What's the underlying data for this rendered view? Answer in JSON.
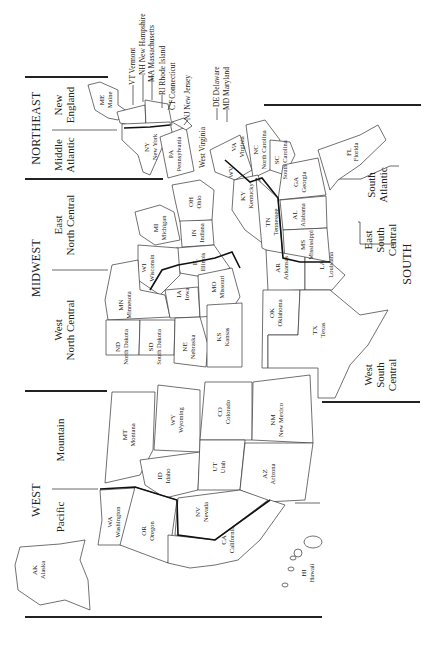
{
  "regions": [
    {
      "id": "northeast",
      "label": "NORTHEAST",
      "divisions": [
        {
          "id": "new-england",
          "label_line1": "New",
          "label_line2": "England"
        },
        {
          "id": "middle-atlantic",
          "label_line1": "Middle",
          "label_line2": "Atlantic"
        }
      ]
    },
    {
      "id": "midwest",
      "label": "MIDWEST",
      "divisions": [
        {
          "id": "east-north-central",
          "label_line1": "East",
          "label_line2": "North Central"
        },
        {
          "id": "west-north-central",
          "label_line1": "West",
          "label_line2": "North Central"
        }
      ]
    },
    {
      "id": "west",
      "label": "WEST",
      "divisions": [
        {
          "id": "mountain",
          "label_line1": "Mountain",
          "label_line2": ""
        },
        {
          "id": "pacific",
          "label_line1": "Pacific",
          "label_line2": ""
        }
      ]
    },
    {
      "id": "south",
      "label": "SOUTH",
      "divisions": [
        {
          "id": "south-atlantic",
          "label_line1": "South",
          "label_line2": "Atlantic"
        },
        {
          "id": "east-south-central",
          "label_line1": "East",
          "label_line2": "South",
          "label_line3": "Central"
        },
        {
          "id": "west-south-central",
          "label_line1": "West",
          "label_line2": "South",
          "label_line3": "Central"
        }
      ]
    }
  ],
  "callouts": {
    "vt": "VT Vermont",
    "nh": "NH New Hampshire",
    "ma": "MA Massachusetts",
    "ri": "RI Rhode Island",
    "ct": "CT Connecticut",
    "nj": "NJ New Jersey",
    "de": "DE Delaware",
    "md": "MD Maryland",
    "wv_full": "West Virginia"
  },
  "states": {
    "me": {
      "abbr": "ME",
      "name": "Maine"
    },
    "ny": {
      "abbr": "NY",
      "name": "New York"
    },
    "pa": {
      "abbr": "PA",
      "name": "Pennsylvania"
    },
    "oh": {
      "abbr": "OH",
      "name": "Ohio"
    },
    "mi": {
      "abbr": "MI",
      "name": "Michigan"
    },
    "in": {
      "abbr": "IN",
      "name": "Indiana"
    },
    "il": {
      "abbr": "IL",
      "name": "Illinois"
    },
    "wi": {
      "abbr": "WI",
      "name": "Wisconsin"
    },
    "mn": {
      "abbr": "MN",
      "name": "Minnesota"
    },
    "ia": {
      "abbr": "IA",
      "name": "Iowa"
    },
    "mo": {
      "abbr": "MO",
      "name": "Missouri"
    },
    "nd": {
      "abbr": "ND",
      "name": "North Dakota"
    },
    "sd": {
      "abbr": "SD",
      "name": "South Dakota"
    },
    "ne": {
      "abbr": "NE",
      "name": "Nebraska"
    },
    "ks": {
      "abbr": "KS",
      "name": "Kansas"
    },
    "wv": {
      "abbr": "WV",
      "name": ""
    },
    "va": {
      "abbr": "VA",
      "name": "Virginia"
    },
    "nc": {
      "abbr": "NC",
      "name": "North Carolina"
    },
    "sc": {
      "abbr": "SC",
      "name": "South Carolina"
    },
    "ga": {
      "abbr": "GA",
      "name": "Georgia"
    },
    "fl": {
      "abbr": "FL",
      "name": "Florida"
    },
    "ky": {
      "abbr": "KY",
      "name": "Kentucky"
    },
    "tn": {
      "abbr": "TN",
      "name": "Tennessee"
    },
    "al": {
      "abbr": "AL",
      "name": "Alabama"
    },
    "ms": {
      "abbr": "MS",
      "name": "Mississippi"
    },
    "ar": {
      "abbr": "AR",
      "name": "Arkansas"
    },
    "la": {
      "abbr": "LA",
      "name": "Louisiana"
    },
    "ok": {
      "abbr": "OK",
      "name": "Oklahoma"
    },
    "tx": {
      "abbr": "TX",
      "name": "Texas"
    },
    "mt": {
      "abbr": "MT",
      "name": "Montana"
    },
    "wy": {
      "abbr": "WY",
      "name": "Wyoming"
    },
    "co": {
      "abbr": "CO",
      "name": "Colorado"
    },
    "nm": {
      "abbr": "NM",
      "name": "New Mexico"
    },
    "id": {
      "abbr": "ID",
      "name": "Idaho"
    },
    "ut": {
      "abbr": "UT",
      "name": "Utah"
    },
    "az": {
      "abbr": "AZ",
      "name": "Arizona"
    },
    "wa": {
      "abbr": "WA",
      "name": "Washington"
    },
    "or": {
      "abbr": "OR",
      "name": "Oregon"
    },
    "nv": {
      "abbr": "NV",
      "name": "Nevada"
    },
    "ca": {
      "abbr": "CA",
      "name": "California"
    },
    "ak": {
      "abbr": "AK",
      "name": "Alaska"
    },
    "hi": {
      "abbr": "HI",
      "name": "Hawaii"
    }
  }
}
